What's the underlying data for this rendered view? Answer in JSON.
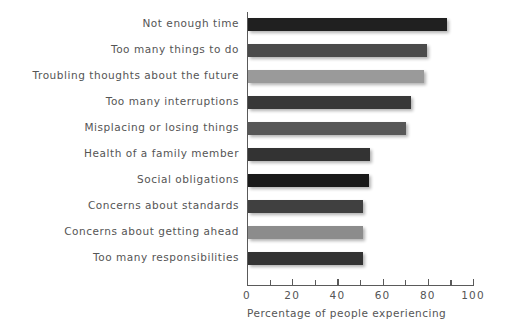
{
  "chart_data": {
    "type": "bar",
    "orientation": "horizontal",
    "title": "",
    "subtitle": "",
    "xlabel": "Percentage of people experiencing",
    "ylabel": "",
    "xlim": [
      0,
      100
    ],
    "xticks": [
      0,
      20,
      40,
      60,
      80,
      100
    ],
    "xtick_labels": [
      "0",
      "20",
      "40",
      "60",
      "80",
      "100"
    ],
    "minor_xticks": [
      10,
      30,
      50,
      70,
      90
    ],
    "grid": false,
    "legend": null,
    "categories": [
      "Not enough time",
      "Too many things to do",
      "Troubling thoughts about the future",
      "Too many interruptions",
      "Misplacing or losing things",
      "Health of a family member",
      "Social obligations",
      "Concerns about standards",
      "Concerns about getting ahead",
      "Too many responsibilities"
    ],
    "values": [
      88,
      79,
      78,
      72,
      70,
      54,
      53.5,
      51,
      51,
      51
    ],
    "bar_colors": [
      "#202020",
      "#4a4a4a",
      "#9a9a9a",
      "#383838",
      "#575757",
      "#333333",
      "#1a1a1a",
      "#404040",
      "#8c8c8c",
      "#333333"
    ]
  },
  "axis": {
    "x_title": "Percentage of people experiencing"
  }
}
